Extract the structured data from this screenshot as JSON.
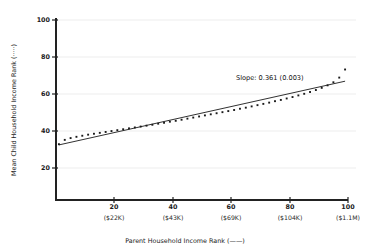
{
  "chart_data": {
    "type": "scatter",
    "title": "",
    "xlabel": "Parent Household Income Rank (——)",
    "ylabel": "Mean Child Household Income Rank (·····)",
    "xlim": [
      0,
      100
    ],
    "ylim": [
      0,
      100
    ],
    "grid": true,
    "legend_position": "in-axis-titles",
    "annotations": [
      {
        "name": "slope-annotation",
        "text": "Slope: 0.361 (0.003)",
        "x": 66,
        "y": 66
      }
    ],
    "xticks": [
      20,
      40,
      60,
      80,
      100
    ],
    "xtick_labels": [
      "20",
      "40",
      "60",
      "80",
      "100"
    ],
    "xtick_sublabels": [
      "($22K)",
      "($43K)",
      "($69K)",
      "($104K)",
      "($1.1M)"
    ],
    "yticks": [
      20,
      40,
      60,
      80,
      100
    ],
    "ytick_labels": [
      "20",
      "40",
      "60",
      "80",
      "100"
    ],
    "series": [
      {
        "name": "Mean Child Household Income Rank",
        "style": "dotted-markers",
        "marker": "square",
        "color": "#1a1a1a",
        "legend_key": "·····",
        "x": [
          1,
          3,
          5,
          7,
          9,
          11,
          13,
          15,
          17,
          19,
          21,
          23,
          25,
          27,
          29,
          31,
          33,
          35,
          37,
          39,
          41,
          43,
          45,
          47,
          49,
          51,
          53,
          55,
          57,
          59,
          61,
          63,
          65,
          67,
          69,
          71,
          73,
          75,
          77,
          79,
          81,
          83,
          85,
          87,
          89,
          91,
          93,
          95,
          97,
          99
        ],
        "values": [
          31.0,
          33.4,
          34.4,
          35.1,
          35.7,
          36.3,
          36.8,
          37.3,
          37.8,
          38.3,
          38.8,
          39.3,
          39.8,
          40.3,
          40.8,
          41.3,
          41.8,
          42.4,
          42.9,
          43.5,
          44.0,
          44.6,
          45.2,
          45.8,
          46.4,
          47.0,
          47.6,
          48.2,
          48.8,
          49.4,
          50.0,
          50.7,
          51.3,
          52.0,
          52.7,
          53.4,
          54.1,
          54.9,
          55.6,
          56.4,
          57.2,
          58.1,
          59.0,
          60.0,
          61.1,
          62.3,
          63.7,
          65.4,
          68.0,
          72.5
        ]
      },
      {
        "name": "Parent Household Income Rank fitted line",
        "style": "solid-line",
        "color": "#1a1a1a",
        "legend_key": "——",
        "slope": 0.361,
        "slope_se": 0.003,
        "x": [
          1,
          99
        ],
        "values": [
          30.6,
          66.0
        ]
      }
    ]
  }
}
